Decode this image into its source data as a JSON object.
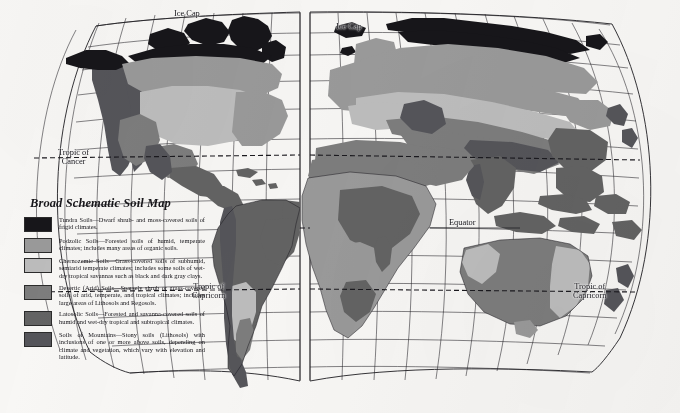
{
  "figure": {
    "title": "Broad Schematic Soil Map",
    "projection": "interrupted homolosine world map",
    "background_color": "#f8f7f5",
    "ink_color": "#1a191e"
  },
  "legend": {
    "title": "Broad Schematic Soil Map",
    "entries": [
      {
        "name": "Tundra Soils",
        "swatch_color": "#17161a",
        "term": "Tundra Soils",
        "description": "—Dwarf shrub- and moss-covered soils of frigid climates.",
        "full_text": "Tundra Soils—Dwarf shrub- and moss-covered soils of frigid climates."
      },
      {
        "name": "Podzolic Soils",
        "swatch_color": "#9a9a9a",
        "term": "Podzolic Soils",
        "description": "—Forested soils of humid, temperate climates; includes many areas of organic soils.",
        "full_text": "Podzolic Soils—Forested soils of humid, temperate climates; includes many areas of organic soils."
      },
      {
        "name": "Chernozemic Soils",
        "swatch_color": "#bdbdbd",
        "term": "Chernozemic Soils",
        "description": "—Grass-covered soils of subhumid, semiarid temperate climates; includes some soils of wet-dry tropical savannas such as black and dark gray clays.",
        "full_text": "Chernozemic Soils—Grass-covered soils of subhumid, semiarid temperate climates; includes some soils of wet-dry tropical savannas such as black and dark gray clays."
      },
      {
        "name": "Desertic (Arid) Soils",
        "swatch_color": "#7d7d7d",
        "term": "Desertic (Arid) Soils",
        "description": "—Sparsely shrub or grass-covered soils of arid, temperate, and tropical climates; includes large areas of Lithosols and Regosols.",
        "full_text": "Desertic (Arid) Soils—Sparsely shrub or grass-covered soils of arid, temperate, and tropical climates; includes large areas of Lithosols and Regosols."
      },
      {
        "name": "Latosolic Soils",
        "swatch_color": "#636363",
        "term": "Latosolic Soils",
        "description": "—Forested and savanna-covered soils of humid and wet-dry tropical and subtropical climates.",
        "full_text": "Latosolic Soils—Forested and savanna-covered soils of humid and wet-dry tropical and subtropical climates."
      },
      {
        "name": "Soils of Mountains",
        "swatch_color": "#55555a",
        "term": "Soils of Mountains",
        "description": "—Stony soils (Lithosols) with inclusions of one or more above soils, depending on climate and vegetation, which vary with elevation and latitude.",
        "full_text": "Soils of Mountains—Stony soils (Lithosols) with inclusions of one or more above soils, depending on climate and vegetation, which vary with elevation and latitude."
      }
    ]
  },
  "map_labels": {
    "ice_cap_left": "Ice Cap",
    "ice_cap_right": "Ice Cap",
    "tropic_of_cancer_line1": "Tropic of",
    "tropic_of_cancer_line2": "Cancer",
    "equator": "Equator",
    "tropic_of_capricorn_left_line1": "Tropic of",
    "tropic_of_capricorn_left_line2": "Capricorn",
    "tropic_of_capricorn_right_line1": "Tropic of",
    "tropic_of_capricorn_right_line2": "Capricorn"
  }
}
